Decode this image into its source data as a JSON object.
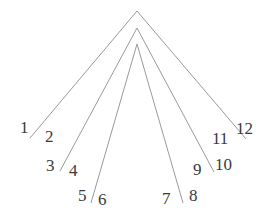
{
  "diagram": {
    "type": "nested-chevrons",
    "line_color": "#9a9a9a",
    "label_color": "#3a3a3a",
    "chevrons": [
      {
        "apex": [
          137,
          11
        ],
        "left": [
          30,
          138
        ],
        "right": [
          246,
          139
        ]
      },
      {
        "apex": [
          137,
          28
        ],
        "left": [
          60,
          171
        ],
        "right": [
          214,
          172
        ]
      },
      {
        "apex": [
          137,
          44
        ],
        "left": [
          91,
          203
        ],
        "right": [
          183,
          203
        ]
      }
    ],
    "labels": [
      {
        "text": "1",
        "x": 20,
        "y": 133
      },
      {
        "text": "2",
        "x": 45,
        "y": 142
      },
      {
        "text": "3",
        "x": 46,
        "y": 171
      },
      {
        "text": "4",
        "x": 69,
        "y": 176
      },
      {
        "text": "5",
        "x": 78,
        "y": 201
      },
      {
        "text": "6",
        "x": 98,
        "y": 205
      },
      {
        "text": "7",
        "x": 162,
        "y": 204
      },
      {
        "text": "8",
        "x": 189,
        "y": 201
      },
      {
        "text": "9",
        "x": 193,
        "y": 175
      },
      {
        "text": "10",
        "x": 215,
        "y": 170
      },
      {
        "text": "11",
        "x": 212,
        "y": 144
      },
      {
        "text": "12",
        "x": 236,
        "y": 134
      }
    ]
  }
}
